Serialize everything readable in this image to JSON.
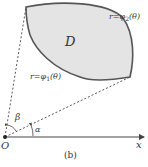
{
  "figure": {
    "caption": "(b)",
    "region_label": "D",
    "curve_outer": {
      "prefix": "r=φ",
      "sub": "2",
      "suffix": "(θ)"
    },
    "curve_inner": {
      "prefix": "r=φ",
      "sub": "1",
      "suffix": "(θ)"
    },
    "angle_beta": "β",
    "angle_alpha": "α",
    "origin_label": "O",
    "axis_label": "x",
    "colors": {
      "region_fill": "#e4e4e4",
      "region_stroke": "#555555",
      "lines": "#444444",
      "text": "#333333"
    }
  }
}
